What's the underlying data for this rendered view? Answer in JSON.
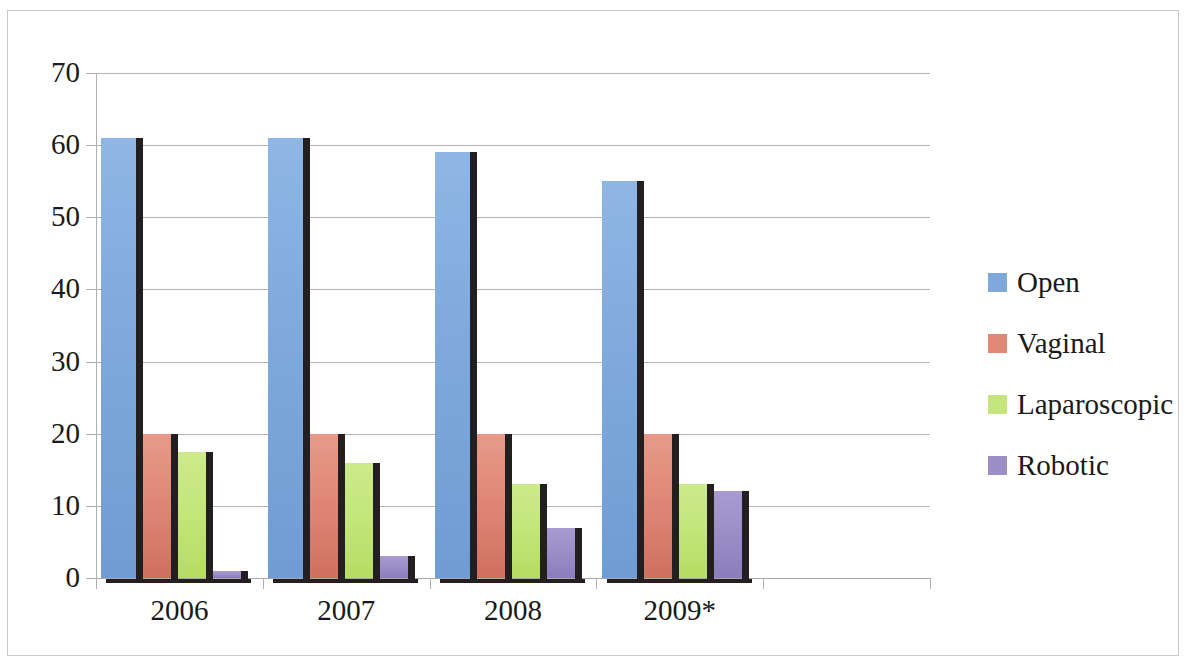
{
  "chart_data": {
    "type": "bar",
    "title": "",
    "subtitle": "",
    "xlabel": "",
    "ylabel": "",
    "categories": [
      "2006",
      "2007",
      "2008",
      "2009*"
    ],
    "series": [
      {
        "name": "Open",
        "color": "#7FA9DC",
        "values": [
          61,
          61,
          59,
          55
        ]
      },
      {
        "name": "Vaginal",
        "color": "#DF8878",
        "values": [
          20,
          20,
          20,
          20
        ]
      },
      {
        "name": "Laparoscopic",
        "color": "#C5E67C",
        "values": [
          17.5,
          16,
          13,
          13
        ]
      },
      {
        "name": "Robotic",
        "color": "#9C8FC8",
        "values": [
          1,
          3,
          7,
          12
        ]
      }
    ],
    "ylim": [
      0,
      70
    ],
    "ytick_step": 10,
    "yticks": [
      "0",
      "10",
      "20",
      "30",
      "40",
      "50",
      "60",
      "70"
    ],
    "grid": true,
    "grid_axis": "y",
    "legend_position": "right",
    "legend_entries": [
      "Open",
      "Vaginal",
      "Laparoscopic",
      "Robotic"
    ],
    "annotations": [],
    "style": "3d-clustered-column"
  },
  "axes": {
    "y": {
      "ticks": [
        {
          "label": "70",
          "value": 70
        },
        {
          "label": "60",
          "value": 60
        },
        {
          "label": "50",
          "value": 50
        },
        {
          "label": "40",
          "value": 40
        },
        {
          "label": "30",
          "value": 30
        },
        {
          "label": "20",
          "value": 20
        },
        {
          "label": "10",
          "value": 10
        },
        {
          "label": "0",
          "value": 0
        }
      ]
    },
    "x": {
      "ticks": [
        {
          "label": "2006"
        },
        {
          "label": "2007"
        },
        {
          "label": "2008"
        },
        {
          "label": "2009*"
        }
      ]
    }
  },
  "legend": {
    "items": [
      {
        "label": "Open",
        "color": "#7FA9DC"
      },
      {
        "label": "Vaginal",
        "color": "#DF8878"
      },
      {
        "label": "Laparoscopic",
        "color": "#C5E67C"
      },
      {
        "label": "Robotic",
        "color": "#9C8FC8"
      }
    ]
  },
  "colors": {
    "open": "#7FA9DC",
    "vaginal": "#DF8878",
    "laparoscopic": "#C5E67C",
    "robotic": "#9C8FC8",
    "gridline": "#b5b5b5",
    "axis": "#a8a8a8",
    "shadow": "#231f20",
    "background": "#ffffff",
    "frame": "#c9c9c9",
    "text": "#1a1a1a"
  }
}
